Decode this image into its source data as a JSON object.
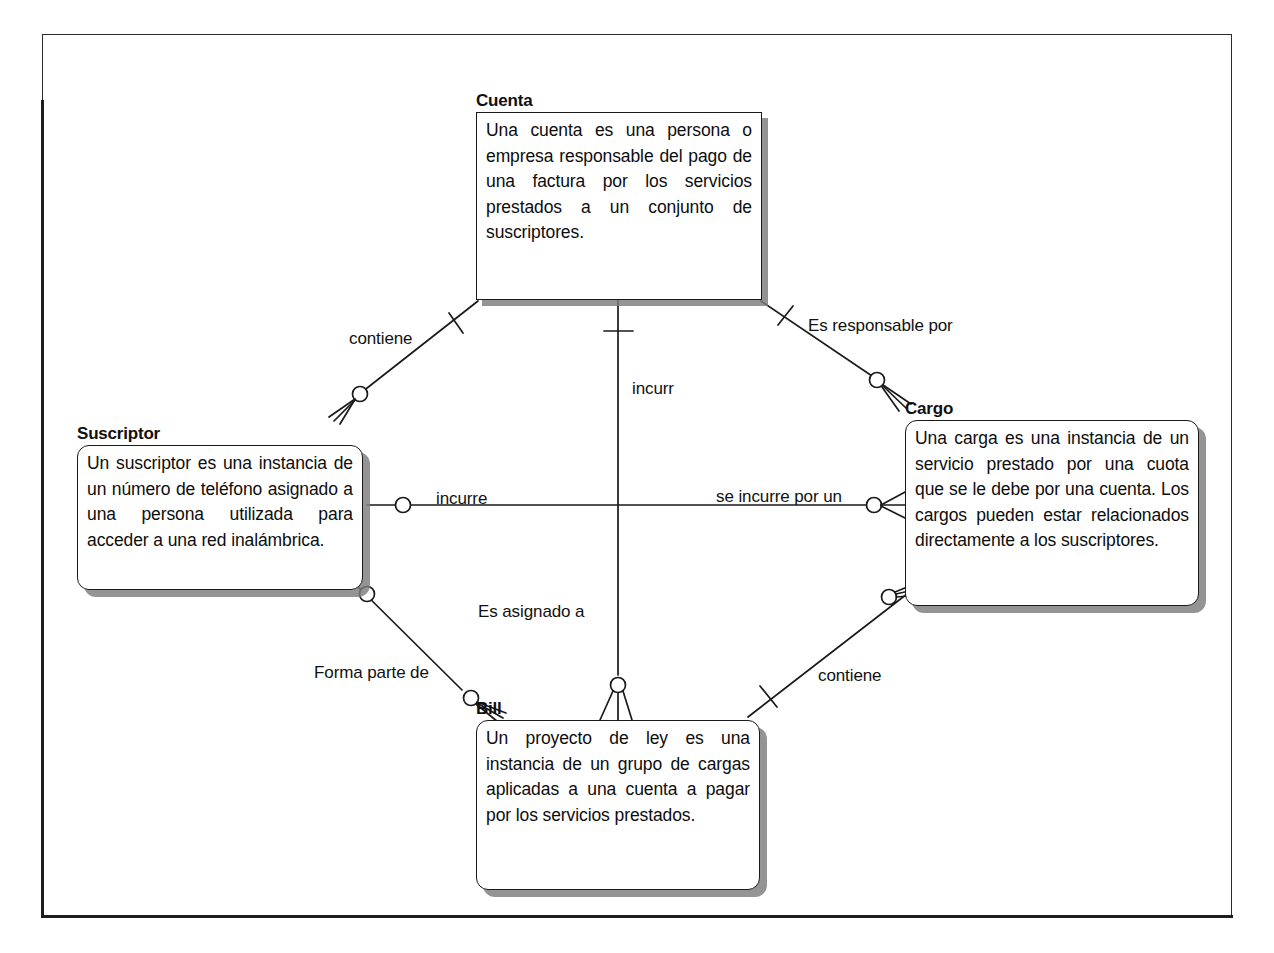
{
  "diagram": {
    "type": "entity-relationship",
    "notation": "crows-foot",
    "background_color": "#ffffff",
    "line_color": "#1a1a1a",
    "shadow_color": "#7d7d7d"
  },
  "entities": [
    {
      "id": "cuenta",
      "title": "Cuenta",
      "description": "Una cuenta es una persona o empresa responsable del pago de una factura por los servicios prestados a un conjunto de suscriptores.",
      "shape": "rectangle"
    },
    {
      "id": "suscriptor",
      "title": "Suscriptor",
      "description": "Un suscriptor es una instancia de un número de teléfono asignado a una persona utilizada para acceder a una red inalámbrica.",
      "shape": "rounded-rectangle"
    },
    {
      "id": "cargo",
      "title": "Cargo",
      "description": "Una carga es una instancia de un servicio prestado por una cuota que se le debe por una cuenta. Los cargos pueden estar relacionados directamente a los suscriptores.",
      "shape": "rounded-rectangle"
    },
    {
      "id": "bill",
      "title": "Bill",
      "description": "Un proyecto de ley es una instancia de un grupo de cargas aplicadas a una cuenta a pagar por los servicios prestados.",
      "shape": "rounded-rectangle"
    }
  ],
  "relationships": [
    {
      "id": "cuenta-suscriptor",
      "label": "contiene",
      "from": "cuenta",
      "to": "suscriptor",
      "from_cardinality": "one",
      "to_cardinality": "zero-or-many"
    },
    {
      "id": "cuenta-cargo",
      "label": "Es responsable por",
      "from": "cuenta",
      "to": "cargo",
      "from_cardinality": "one",
      "to_cardinality": "zero-or-many"
    },
    {
      "id": "cuenta-bill",
      "label": "incurr",
      "from": "cuenta",
      "to": "bill",
      "from_cardinality": "one",
      "to_cardinality": "zero-or-many"
    },
    {
      "id": "bill-asignado",
      "label": "Es asignado a",
      "from": "bill",
      "to": "cuenta",
      "from_cardinality": "zero-or-many",
      "to_cardinality": "one"
    },
    {
      "id": "suscriptor-cargo",
      "label": "incurre",
      "from": "suscriptor",
      "to": "cargo",
      "from_cardinality": "zero-or-one",
      "to_cardinality": "zero-or-many"
    },
    {
      "id": "cargo-suscriptor",
      "label": "se incurre por un",
      "from": "cargo",
      "to": "suscriptor",
      "from_cardinality": "zero-or-many",
      "to_cardinality": "zero-or-one"
    },
    {
      "id": "suscriptor-bill",
      "label": "Forma parte de",
      "from": "suscriptor",
      "to": "bill",
      "from_cardinality": "zero-or-one",
      "to_cardinality": "zero-or-many"
    },
    {
      "id": "cargo-bill",
      "label": "contiene",
      "from": "cargo",
      "to": "bill",
      "from_cardinality": "zero-or-many",
      "to_cardinality": "one"
    }
  ],
  "caption": ""
}
